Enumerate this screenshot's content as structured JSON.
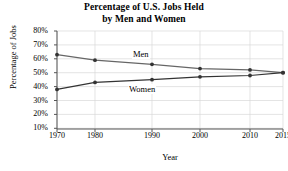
{
  "chart_data": {
    "type": "line",
    "title": "Percentage of U.S. Jobs Held by Men and Women",
    "title_line1": "Percentage of U.S. Jobs Held",
    "title_line2": "by Men and Women",
    "xlabel": "Year",
    "ylabel": "Percentage of Jobs",
    "x": [
      1970,
      1980,
      1990,
      2000,
      2010,
      2015
    ],
    "xticklabels": [
      "1970",
      "1980",
      "1990",
      "2000",
      "2010",
      "2015"
    ],
    "yticklabels": [
      "80%",
      "70%",
      "60%",
      "50%",
      "40%",
      "30%",
      "20%",
      "10%"
    ],
    "ytickvalues": [
      80,
      70,
      60,
      50,
      40,
      30,
      20,
      10
    ],
    "xlim": [
      1970,
      2015
    ],
    "ylim": [
      5,
      80
    ],
    "grid": true,
    "legend_position": "inline-annotation",
    "series": [
      {
        "name": "Men",
        "label": "Men",
        "color": "#555555",
        "values": [
          63,
          59,
          56,
          53,
          52,
          50
        ]
      },
      {
        "name": "Women",
        "label": "Women",
        "color": "#333333",
        "values": [
          38,
          43,
          45,
          47,
          48,
          50
        ]
      }
    ]
  },
  "colors": {
    "axis": "#555555",
    "grid": "#d8d8d8",
    "men_line": "#666666",
    "women_line": "#333333",
    "marker": "#333333",
    "text": "#000000"
  }
}
